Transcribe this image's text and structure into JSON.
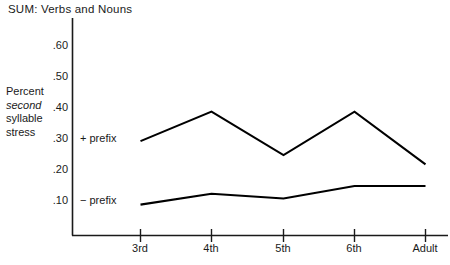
{
  "chart_data": {
    "type": "line",
    "title": "SUM: Verbs and Nouns",
    "ylabel_lines": [
      "Percent",
      "second",
      "syllable",
      "stress"
    ],
    "ylabel_italic_index": 1,
    "xlabel": "",
    "categories": [
      "3rd",
      "4th",
      "5th",
      "6th",
      "Adult"
    ],
    "yticks": [
      ".10",
      ".20",
      ".30",
      ".40",
      ".50",
      ".60"
    ],
    "ytick_values": [
      0.1,
      0.2,
      0.3,
      0.4,
      0.5,
      0.6
    ],
    "ylim": [
      0.0,
      0.63
    ],
    "grid": false,
    "legend_position": "inline-left",
    "series": [
      {
        "name": "+ prefix",
        "label": "+ prefix",
        "color": "#000000",
        "values": [
          0.29,
          0.385,
          0.245,
          0.385,
          0.215
        ]
      },
      {
        "name": "- prefix",
        "label": "− prefix",
        "color": "#000000",
        "values": [
          0.085,
          0.12,
          0.105,
          0.145,
          0.145
        ]
      }
    ]
  },
  "axes": {
    "axis_color": "#1a1a1a",
    "line_color": "#000000"
  }
}
